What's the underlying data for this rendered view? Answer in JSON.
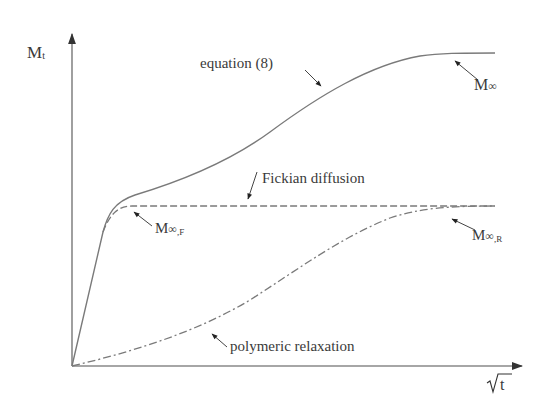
{
  "diagram": {
    "y_axis_label": "M",
    "y_axis_label_sub": "t",
    "x_axis_label": "t",
    "x_axis_radical": "√",
    "curves": [
      {
        "name": "equation-8",
        "label": "equation (8)",
        "style": "solid"
      },
      {
        "name": "fickian-diffusion",
        "label": "Fickian diffusion",
        "style": "dashed"
      },
      {
        "name": "polymeric-relaxation",
        "label": "polymeric relaxation",
        "style": "dash-dot"
      }
    ],
    "annotations": {
      "m_inf": {
        "main": "M",
        "sym": "∞",
        "sub": ""
      },
      "m_inf_f": {
        "main": "M",
        "sym": "∞",
        "sub": ",F"
      },
      "m_inf_r": {
        "main": "M",
        "sym": "∞",
        "sub": ",R"
      }
    },
    "colors": {
      "line": "#7a7a7a",
      "axis": "#888888",
      "arrow": "#222222",
      "text": "#3a3a3a"
    }
  }
}
